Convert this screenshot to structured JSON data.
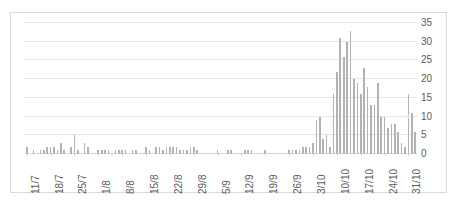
{
  "chart_data": {
    "type": "bar",
    "title": "",
    "xlabel": "",
    "ylabel": "",
    "ylim": [
      0,
      35
    ],
    "yticks": [
      0,
      5,
      10,
      15,
      20,
      25,
      30,
      35
    ],
    "grid": true,
    "legend": null,
    "bar_color": "#b3b3b3",
    "gridline_color": "#e6e6e6",
    "axis_text_color": "#5c5c5c",
    "xtick_labels": [
      "11/7",
      "18/7",
      "25/7",
      "1/8",
      "8/8",
      "15/8",
      "22/8",
      "29/8",
      "5/9",
      "12/9",
      "19/9",
      "26/9",
      "3/10",
      "10/10",
      "17/10",
      "24/10",
      "31/10"
    ],
    "xtick_interval_days": 7,
    "categories": [
      "11/7",
      "12/7",
      "13/7",
      "14/7",
      "15/7",
      "16/7",
      "17/7",
      "18/7",
      "19/7",
      "20/7",
      "21/7",
      "22/7",
      "23/7",
      "24/7",
      "25/7",
      "26/7",
      "27/7",
      "28/7",
      "29/7",
      "30/7",
      "31/7",
      "1/8",
      "2/8",
      "3/8",
      "4/8",
      "5/8",
      "6/8",
      "7/8",
      "8/8",
      "9/8",
      "10/8",
      "11/8",
      "12/8",
      "13/8",
      "14/8",
      "15/8",
      "16/8",
      "17/8",
      "18/8",
      "19/8",
      "20/8",
      "21/8",
      "22/8",
      "23/8",
      "24/8",
      "25/8",
      "26/8",
      "27/8",
      "28/8",
      "29/8",
      "30/8",
      "31/8",
      "1/9",
      "2/9",
      "3/9",
      "4/9",
      "5/9",
      "6/9",
      "7/9",
      "8/9",
      "9/9",
      "10/9",
      "11/9",
      "12/9",
      "13/9",
      "14/9",
      "15/9",
      "16/9",
      "17/9",
      "18/9",
      "19/9",
      "20/9",
      "21/9",
      "22/9",
      "23/9",
      "24/9",
      "25/9",
      "26/9",
      "27/9",
      "28/9",
      "29/9",
      "30/9",
      "1/10",
      "2/10",
      "3/10",
      "4/10",
      "5/10",
      "6/10",
      "7/10",
      "8/10",
      "9/10",
      "10/10",
      "11/10",
      "12/10",
      "13/10",
      "14/10",
      "15/10",
      "16/10",
      "17/10",
      "18/10",
      "19/10",
      "20/10",
      "21/10",
      "22/10",
      "23/10",
      "24/10",
      "25/10",
      "26/10",
      "27/10",
      "28/10",
      "29/10",
      "30/10",
      "31/10",
      "1/11",
      "2/11"
    ],
    "values": [
      2,
      0,
      1,
      0,
      1,
      1,
      2,
      2,
      2,
      1,
      3,
      1,
      0,
      2,
      5,
      1,
      0,
      3,
      2,
      0,
      0,
      1,
      1,
      1,
      1,
      0,
      1,
      1,
      1,
      1,
      0,
      1,
      1,
      0,
      0,
      2,
      1,
      0,
      2,
      2,
      1,
      2,
      2,
      2,
      2,
      1,
      1,
      1,
      2,
      2,
      1,
      0,
      0,
      0,
      0,
      0,
      1,
      0,
      0,
      1,
      1,
      0,
      0,
      0,
      1,
      1,
      1,
      0,
      0,
      0,
      1,
      0,
      0,
      0,
      0,
      0,
      0,
      1,
      1,
      1,
      1,
      2,
      2,
      2,
      3,
      9,
      10,
      4,
      5,
      2,
      16,
      22,
      31,
      26,
      30,
      33,
      20,
      19,
      16,
      23,
      18,
      13,
      13,
      19,
      10,
      10,
      7,
      8,
      8,
      6,
      3,
      2,
      16,
      11,
      6
    ]
  }
}
